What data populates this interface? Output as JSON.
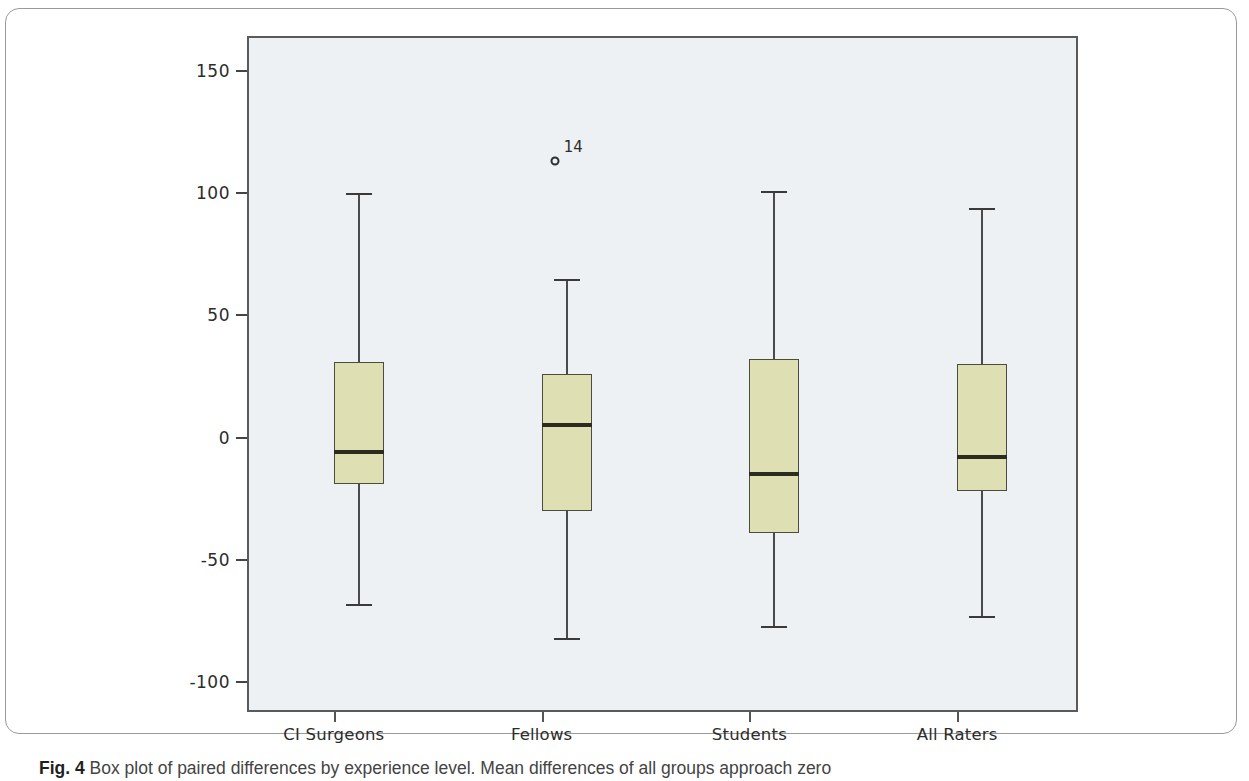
{
  "figure": {
    "caption_label": "Fig. 4",
    "caption_text": "Box plot of paired differences by experience level. Mean differences of all groups approach zero"
  },
  "chart_data": {
    "type": "box",
    "title": "",
    "xlabel": "",
    "ylabel": "",
    "ylim": [
      -120,
      165
    ],
    "yticks": [
      150,
      100,
      50,
      0,
      -50,
      -100
    ],
    "ytick_labels": [
      "150",
      "100",
      "50",
      "0",
      "-50",
      "-100"
    ],
    "grid": false,
    "legend": "none",
    "categories": [
      "CI Surgeons",
      "Fellows",
      "Students",
      "All Raters"
    ],
    "boxes": [
      {
        "name": "CI Surgeons",
        "whisker_high": 100,
        "q3": 31,
        "median": -6,
        "q1": -19,
        "whisker_low": -68,
        "outliers": []
      },
      {
        "name": "Fellows",
        "whisker_high": 65,
        "q3": 26,
        "median": 5,
        "q1": -30,
        "whisker_low": -82,
        "outliers": [
          {
            "value": 113,
            "label": "14"
          }
        ]
      },
      {
        "name": "Students",
        "whisker_high": 101,
        "q3": 32,
        "median": -15,
        "q1": -39,
        "whisker_low": -77,
        "outliers": []
      },
      {
        "name": "All Raters",
        "whisker_high": 94,
        "q3": 30,
        "median": -8,
        "q1": -22,
        "whisker_low": -73,
        "outliers": []
      }
    ],
    "colors": {
      "box_fill": "#dfdfb4",
      "box_edge": "#4b4b3e",
      "median": "#2b2b20",
      "whisker": "#4a4a4a",
      "panel_background": "#eef1f4",
      "panel_border": "#5a5a5a"
    }
  }
}
